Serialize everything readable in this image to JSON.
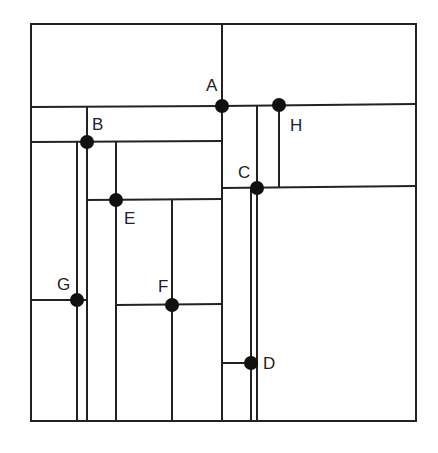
{
  "diagram": {
    "title": "",
    "type": "kd-tree spatial subdivision",
    "colors": {
      "line": "#222222",
      "point": "#111111",
      "background": "#ffffff"
    },
    "points": [
      {
        "label": "A",
        "x": 222,
        "y": 106,
        "lx": 206,
        "ly": 91
      },
      {
        "label": "B",
        "x": 87,
        "y": 142,
        "lx": 92,
        "ly": 129
      },
      {
        "label": "C",
        "x": 257,
        "y": 188,
        "lx": 238,
        "ly": 178
      },
      {
        "label": "D",
        "x": 251,
        "y": 363,
        "lx": 263,
        "ly": 369
      },
      {
        "label": "E",
        "x": 116,
        "y": 200,
        "lx": 124,
        "ly": 224
      },
      {
        "label": "F",
        "x": 172,
        "y": 305,
        "lx": 158,
        "ly": 292
      },
      {
        "label": "G",
        "x": 77,
        "y": 300,
        "lx": 57,
        "ly": 290
      },
      {
        "label": "H",
        "x": 279,
        "y": 105,
        "lx": 290,
        "ly": 131
      }
    ],
    "labels": {
      "A": "A",
      "B": "B",
      "C": "C",
      "D": "D",
      "E": "E",
      "F": "F",
      "G": "G",
      "H": "H"
    }
  }
}
